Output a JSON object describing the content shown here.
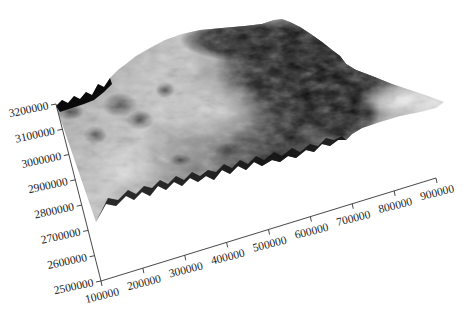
{
  "chart_data": {
    "type": "surface3d",
    "title": "",
    "xlabel": "",
    "ylabel": "",
    "zlabel": "",
    "colormap": "grayscale",
    "x_axis": {
      "ticks": [
        100000,
        200000,
        300000,
        400000,
        500000,
        600000,
        700000,
        800000,
        900000
      ],
      "tick_labels": [
        "100000",
        "200000",
        "300000",
        "400000",
        "500000",
        "600000",
        "700000",
        "800000",
        "900000"
      ],
      "range": [
        100000,
        900000
      ]
    },
    "y_axis": {
      "ticks": [
        2500000,
        2600000,
        2700000,
        2800000,
        2900000,
        3000000,
        3100000,
        3200000
      ],
      "tick_labels": [
        "2500000",
        "2600000",
        "2700000",
        "2800000",
        "2900000",
        "3000000",
        "3100000",
        "3200000"
      ],
      "range": [
        2500000,
        3200000
      ]
    },
    "grid": false,
    "legend": "none"
  }
}
